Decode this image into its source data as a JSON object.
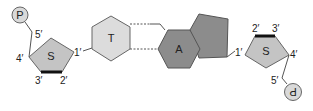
{
  "diagram": {
    "left_nucleotide": {
      "phosphate": "P",
      "sugar": "S",
      "base": "T",
      "carbon_labels": {
        "c5": "5′",
        "c4": "4′",
        "c3": "3′",
        "c2": "2′",
        "c1": "1′"
      }
    },
    "right_nucleotide": {
      "phosphate": "P",
      "sugar": "S",
      "base": "A",
      "carbon_labels": {
        "c5": "5′",
        "c4": "4′",
        "c3": "3′",
        "c2": "2′",
        "c1": "1′"
      }
    },
    "colors": {
      "phosphate_fill": "#d9d9d9",
      "sugar_fill": "#c4c4c4",
      "thymine_fill": "#dcdcdc",
      "adenine_fill": "#8c8c8c",
      "stroke": "#555555",
      "bold_edge": "#111111"
    }
  }
}
